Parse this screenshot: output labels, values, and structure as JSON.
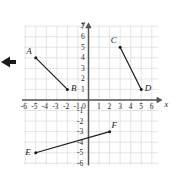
{
  "figure": {
    "type": "coordinate-plane",
    "axis_labels": {
      "x": "x",
      "y": "y"
    },
    "origin_label": "0",
    "x_ticks": [
      "-6",
      "-5",
      "-4",
      "-3",
      "-2",
      "-1",
      "1",
      "2",
      "3",
      "4",
      "5",
      "6"
    ],
    "y_ticks": [
      "7",
      "6",
      "5",
      "4",
      "3",
      "2",
      "1",
      "-1",
      "-2",
      "-3",
      "-4",
      "-5",
      "-6"
    ],
    "colors": {
      "grid": "#d8d8d8",
      "axis": "#555555",
      "segment": "#1a1a1a",
      "label": "#1a1a1a",
      "background": "#ffffff"
    }
  },
  "chart_data": {
    "type": "scatter",
    "title": "",
    "xlabel": "x",
    "ylabel": "y",
    "xlim": [
      -6.5,
      6.8
    ],
    "ylim": [
      -6.3,
      7.2
    ],
    "grid": true,
    "legend": "none",
    "points": [
      {
        "name": "A",
        "x": -5,
        "y": 4,
        "label": "A",
        "label_pos": "above-left"
      },
      {
        "name": "B",
        "x": -2,
        "y": 1,
        "label": "B",
        "label_pos": "right"
      },
      {
        "name": "C",
        "x": 3,
        "y": 5,
        "label": "C",
        "label_pos": "above-left"
      },
      {
        "name": "D",
        "x": 5,
        "y": 1,
        "label": "D",
        "label_pos": "right"
      },
      {
        "name": "E",
        "x": -5,
        "y": -5,
        "label": "E",
        "label_pos": "below-left"
      },
      {
        "name": "F",
        "x": 2,
        "y": -3,
        "label": "F",
        "label_pos": "above-right"
      }
    ],
    "segments": [
      {
        "name": "AB",
        "from": "A",
        "to": "B"
      },
      {
        "name": "CD",
        "from": "C",
        "to": "D"
      },
      {
        "name": "EF",
        "from": "E",
        "to": "F"
      }
    ]
  },
  "overlay": {
    "pointer_icon": "left-arrow-pointer"
  }
}
